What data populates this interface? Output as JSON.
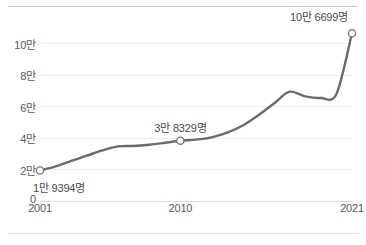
{
  "chart_data": {
    "type": "line",
    "title": "",
    "subtitle": "",
    "xlabel": "",
    "ylabel": "",
    "grid": true,
    "legend": false,
    "xlim": [
      2001,
      2021
    ],
    "ylim": [
      0,
      110000
    ],
    "y_tick_values": [
      0,
      20000,
      40000,
      60000,
      80000,
      100000
    ],
    "y_tick_labels": [
      "0",
      "2만",
      "4만",
      "6만",
      "8만",
      "10만"
    ],
    "x_tick_values": [
      2001,
      2010,
      2021
    ],
    "x_tick_labels": [
      "2001",
      "2010",
      "2021"
    ],
    "series": [
      {
        "name": "",
        "color": "#6b6b6b",
        "x": [
          2001,
          2002,
          2003,
          2004,
          2005,
          2006,
          2007,
          2008,
          2009,
          2010,
          2011,
          2012,
          2013,
          2014,
          2015,
          2016,
          2017,
          2018,
          2019,
          2020,
          2021
        ],
        "values": [
          19394,
          22000,
          25500,
          28800,
          32200,
          34700,
          35000,
          35800,
          37000,
          38329,
          39000,
          40500,
          43500,
          48000,
          54500,
          62000,
          69500,
          66500,
          65500,
          68000,
          106699
        ]
      }
    ],
    "annotations": [
      {
        "name": "point-label-2001",
        "x": 2001,
        "y": 19394,
        "text": "1만 9394명",
        "position": "below"
      },
      {
        "name": "point-label-2010",
        "x": 2010,
        "y": 38329,
        "text": "3만 8329명",
        "position": "above"
      },
      {
        "name": "point-label-2021",
        "x": 2021,
        "y": 106699,
        "text": "10만 6699명",
        "position": "above-left"
      }
    ],
    "markers": [
      {
        "x": 2001,
        "y": 19394
      },
      {
        "x": 2010,
        "y": 38329
      },
      {
        "x": 2021,
        "y": 106699
      }
    ],
    "colors": {
      "line": "#6b6b6b",
      "marker_fill": "#ffffff",
      "marker_stroke": "#7a7a7a",
      "grid": "#ededed",
      "axis_text": "#585858",
      "label_text": "#4a4a4a",
      "frame_top": "#c9c9c9",
      "frame_bottom": "#e3e3e3",
      "background": "#ffffff"
    }
  }
}
